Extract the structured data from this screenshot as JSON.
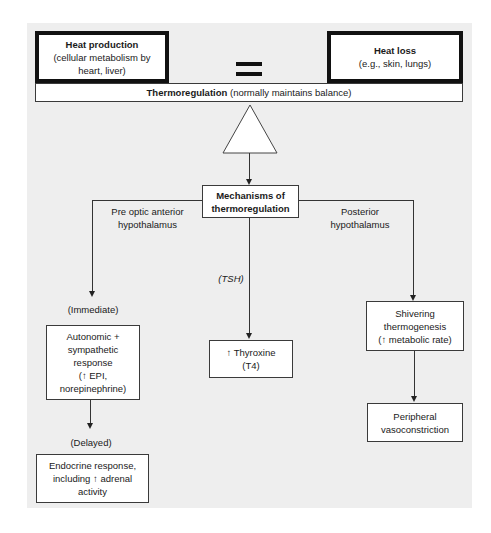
{
  "top": {
    "heat_production": {
      "title": "Heat production",
      "detail": "(cellular metabolism by heart, liver)"
    },
    "equals_symbol": "=",
    "heat_loss": {
      "title": "Heat loss",
      "detail": "(e.g., skin, lungs)"
    },
    "thermoregulation": {
      "title": "Thermoregulation",
      "detail": " (normally maintains balance)"
    }
  },
  "center": {
    "mechanisms": {
      "line1": "Mechanisms of",
      "line2": "thermoregulation"
    }
  },
  "branches": {
    "left": {
      "label_line1": "Pre optic anterior",
      "label_line2": "hypothalamus",
      "timing_immediate": "(Immediate)",
      "autonomic": [
        "Autonomic +",
        "sympathetic",
        "response",
        "(↑ EPI,",
        "norepinephrine)"
      ],
      "timing_delayed": "(Delayed)",
      "endocrine": [
        "Endocrine response,",
        "including ↑ adrenal",
        "activity"
      ]
    },
    "middle": {
      "label": "(TSH)",
      "thyroxine": [
        "↑ Thyroxine",
        "(T4)"
      ]
    },
    "right": {
      "label_line1": "Posterior",
      "label_line2": "hypothalamus",
      "shivering": [
        "Shivering",
        "thermogenesis",
        "(↑ metabolic rate)"
      ],
      "peripheral": [
        "Peripheral",
        "vasoconstriction"
      ]
    }
  }
}
